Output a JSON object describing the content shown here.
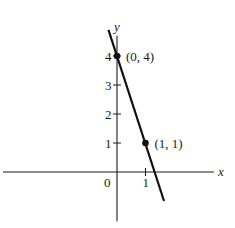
{
  "chart_data": {
    "type": "line",
    "title": "",
    "xlabel": "x",
    "ylabel": "y",
    "xlim": [
      -4.0,
      3.4
    ],
    "ylim": [
      -1.7,
      4.7
    ],
    "origin_label": "0",
    "x_ticks": [
      {
        "value": 1,
        "label": "1"
      }
    ],
    "y_ticks": [
      {
        "value": 1,
        "label": "1"
      },
      {
        "value": 2,
        "label": "2"
      },
      {
        "value": 3,
        "label": "3"
      },
      {
        "value": 4,
        "label": "4"
      }
    ],
    "grid": false,
    "series": [
      {
        "name": "line",
        "equation": "y = -3x + 4",
        "x": [
          -0.3,
          1.65
        ],
        "y": [
          4.9,
          -1.0
        ]
      }
    ],
    "points": [
      {
        "x": 0,
        "y": 4,
        "label": "(0, 4)"
      },
      {
        "x": 1,
        "y": 1,
        "label": "(1, 1)"
      }
    ]
  }
}
